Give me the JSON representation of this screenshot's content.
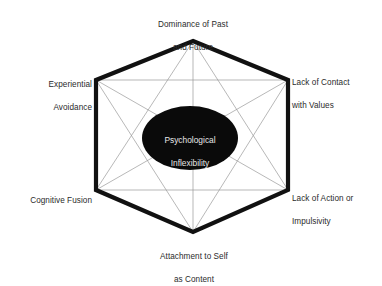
{
  "diagram": {
    "type": "hexaflex",
    "background_color": "#ffffff",
    "center": {
      "label": "Psychological\nInflexibility",
      "line1": "Psychological",
      "line2": "Inflexibility",
      "fill_color": "#0a0a0a",
      "text_color": "#e8e8e8",
      "cx": 190,
      "cy": 138,
      "rx": 48,
      "ry": 32
    },
    "hexagon": {
      "stroke_color": "#111111",
      "stroke_width": 4.2,
      "fill_color": "#ffffff",
      "vertices": [
        {
          "id": "top",
          "x": 193,
          "y": 41
        },
        {
          "id": "upper-right",
          "x": 288,
          "y": 80
        },
        {
          "id": "lower-right",
          "x": 288,
          "y": 190
        },
        {
          "id": "bottom",
          "x": 193,
          "y": 232
        },
        {
          "id": "lower-left",
          "x": 96,
          "y": 190
        },
        {
          "id": "upper-left",
          "x": 96,
          "y": 80
        }
      ]
    },
    "inner_lines": {
      "stroke_color": "#9a9a9a",
      "stroke_width": 0.7,
      "description": "complete graph connecting every pair of hexagon vertices"
    },
    "nodes": [
      {
        "id": "dominance-of-past-and-future",
        "label": "Dominance of Past\nand Future",
        "line1": "Dominance of Past",
        "line2": "and Future",
        "vertex": "top",
        "position": "above"
      },
      {
        "id": "lack-of-contact-with-values",
        "label": "Lack of Contact\nwith Values",
        "line1": "Lack of Contact",
        "line2": "with Values",
        "vertex": "upper-right",
        "position": "right"
      },
      {
        "id": "lack-of-action-or-impulsivity",
        "label": "Lack of Action or\nImpulsivity",
        "line1": "Lack of Action or",
        "line2": "Impulsivity",
        "vertex": "lower-right",
        "position": "right"
      },
      {
        "id": "attachment-to-self-as-content",
        "label": "Attachment to Self\nas Content",
        "line1": "Attachment to Self",
        "line2": "as Content",
        "vertex": "bottom",
        "position": "below"
      },
      {
        "id": "cognitive-fusion",
        "label": "Cognitive Fusion",
        "line1": "Cognitive Fusion",
        "line2": "",
        "vertex": "lower-left",
        "position": "left"
      },
      {
        "id": "experiential-avoidance",
        "label": "Experiential\nAvoidance",
        "line1": "Experiential",
        "line2": "Avoidance",
        "vertex": "upper-left",
        "position": "left"
      }
    ]
  }
}
